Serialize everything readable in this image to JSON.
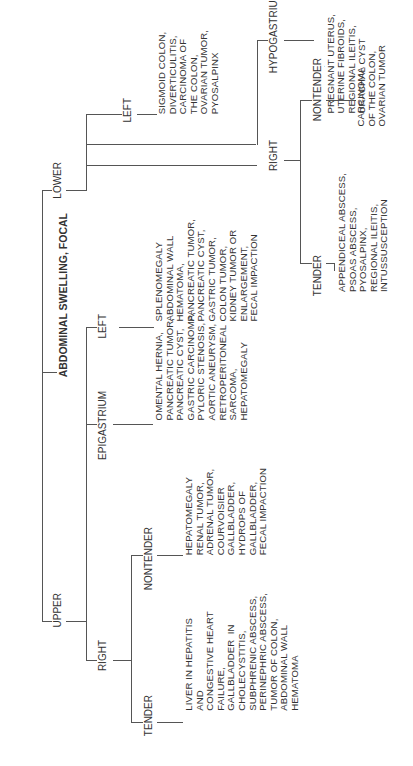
{
  "title": "ABDOMINAL SWELLING, FOCAL",
  "upper": {
    "label": "UPPER",
    "right": {
      "label": "RIGHT",
      "tender": {
        "label": "TENDER",
        "causes": "LIVER IN HEPATITIS\nAND\nCONGESTIVE HEART\nFAILURE,\nGALLBLADDER  IN\nCHOLECYSTITIS,\nSUBPHRENIC ABSCESS,\nPERINEPHRIC ABSCESS,\nTUMOR OF COLON,\nABDOMINAL WALL\nHEMATOMA"
      },
      "nontender": {
        "label": "NONTENDER",
        "causes": "HEPATOMEGALY\nRENAL TUMOR,\nADRENAL TUMOR,\nCOURVOISIER\nGALLBLADDER,\nHYDROPS OF\nGALLBLADDER,\nFECAL IMPACTION"
      }
    },
    "epigastrium": {
      "label": "EPIGASTRIUM",
      "causes": "OMENTAL HERNIA,\nPANCREATIC TUMOR,\nPANCREATIC CYST,\nGASTRIC CARCINOMA,\nPYLORIC STENOSIS,\nAORTIC ANEURYSM,\nRETROPERITONEAL\nSARCOMA,\nHEPATOMEGALY"
    },
    "left": {
      "label": "LEFT",
      "causes": "SPLENOMEGALY\nABDOMINAL WALL\nHEMATOMA,\nPANCREATIC TUMOR,\nPANCREATIC CYST,\nGASTRIC TUMOR,\nCOLON TUMOR,\nKIDNEY TUMOR OR\nENLARGEMENT,\nFECAL IMPACTION"
    }
  },
  "lower": {
    "label": "LOWER",
    "right": {
      "label": "RIGHT",
      "tender": {
        "label": "TENDER",
        "causes": "APPENDICEAL ABSCESS,\nPSOAS ABSCESS,\nPYOSALPINX,\nREGIONAL ILEITIS,\nINTUSSUSCEPTION"
      },
      "nontender": {
        "label": "NONTENDER",
        "causes": "CARCINOMA\nOF THE COLON,\nOVARIAN TUMOR"
      }
    },
    "left": {
      "label": "LEFT",
      "causes": "SIGMOID COLON,\nDIVERTICULITIS,\nCARCINOMA OF\nTHE COLON,\nOVARIAN TUMOR,\nPYOSALPINX"
    },
    "hypogastrium": {
      "label": "HYPOGASTRIUM",
      "causes": "BLADDER,\nPREGNANT UTERUS,\nUTERINE FIBROIDS,\nREGIONAL ILEITIS,\nURACHAL CYST"
    }
  },
  "colors": {
    "line": "#555555",
    "text": "#333333",
    "background": "#ffffff"
  }
}
